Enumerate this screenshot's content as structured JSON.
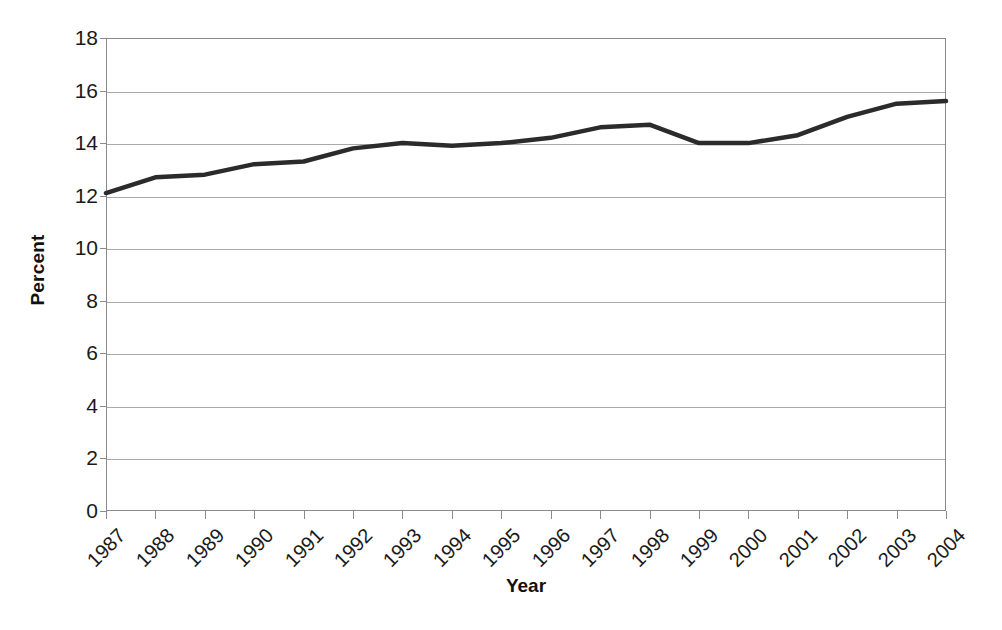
{
  "chart_data": {
    "type": "line",
    "title": "",
    "subtitle": "",
    "xlabel": "Year",
    "ylabel": "Percent",
    "categories": [
      "1987",
      "1988",
      "1989",
      "1990",
      "1991",
      "1992",
      "1993",
      "1994",
      "1995",
      "1996",
      "1997",
      "1998",
      "1999",
      "2000",
      "2001",
      "2002",
      "2003",
      "2004"
    ],
    "x": [
      1987,
      1988,
      1989,
      1990,
      1991,
      1992,
      1993,
      1994,
      1995,
      1996,
      1997,
      1998,
      1999,
      2000,
      2001,
      2002,
      2003,
      2004
    ],
    "values": [
      12.1,
      12.7,
      12.8,
      13.2,
      13.3,
      13.8,
      14.0,
      13.9,
      14.0,
      14.2,
      14.6,
      14.7,
      14.0,
      14.0,
      14.3,
      15.0,
      15.5,
      15.6
    ],
    "series": [
      {
        "name": "Percent",
        "values": [
          12.1,
          12.7,
          12.8,
          13.2,
          13.3,
          13.8,
          14.0,
          13.9,
          14.0,
          14.2,
          14.6,
          14.7,
          14.0,
          14.0,
          14.3,
          15.0,
          15.5,
          15.6
        ],
        "color": "#2b2b2b",
        "line_width": 4.5,
        "markers": false
      }
    ],
    "ylim": [
      0,
      18
    ],
    "ytick_step": 2,
    "yticks": [
      0,
      2,
      4,
      6,
      8,
      10,
      12,
      14,
      16,
      18
    ],
    "ytick_labels": [
      "0",
      "2",
      "4",
      "6",
      "8",
      "10",
      "12",
      "14",
      "16",
      "18"
    ],
    "xlim": [
      1987,
      2004
    ],
    "grid": {
      "horizontal": true,
      "vertical": false,
      "color": "#a9a9a9"
    },
    "legend": {
      "show": false,
      "position": "none",
      "entries": []
    },
    "annotations": [],
    "axis_color": "#8a8a8a",
    "background_color": "#ffffff",
    "xtick_rotation": -45
  }
}
